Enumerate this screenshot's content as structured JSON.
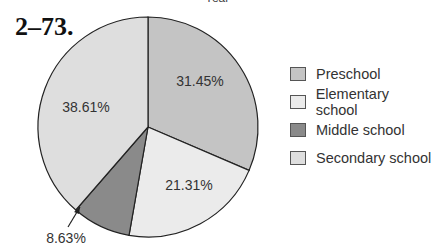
{
  "header": {
    "cut_title": "Year",
    "problem_number": "2–73."
  },
  "chart_data": {
    "type": "pie",
    "title": "",
    "categories": [
      "Preschool",
      "Elementary school",
      "Middle school",
      "Secondary school"
    ],
    "values": [
      31.45,
      21.31,
      8.63,
      38.61
    ],
    "labels": [
      "31.45%",
      "21.31%",
      "8.63%",
      "38.61%"
    ],
    "colors": [
      "#c4c4c4",
      "#ebebeb",
      "#8a8a8a",
      "#dedede"
    ],
    "start_angle": "12 o'clock, clockwise",
    "legend_position": "right",
    "annotations": [
      {
        "text": "8.63%",
        "note": "arrow pointing to Middle school slice"
      }
    ]
  },
  "legend": {
    "items": [
      {
        "label": "Preschool",
        "color": "#c4c4c4"
      },
      {
        "label": "Elementary school",
        "color": "#ebebeb"
      },
      {
        "label": "Middle school",
        "color": "#8a8a8a"
      },
      {
        "label": "Secondary school",
        "color": "#dedede"
      }
    ]
  }
}
